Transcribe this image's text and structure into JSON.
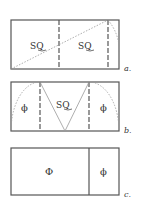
{
  "diagrams": [
    {
      "id": "a",
      "caption": "a.",
      "regions": [
        {
          "label": "SQ"
        },
        {
          "label": "SQ"
        }
      ]
    },
    {
      "id": "b",
      "caption": "b.",
      "regions": [
        {
          "label": "ϕ"
        },
        {
          "label": "SQ"
        },
        {
          "label": "ϕ"
        }
      ]
    },
    {
      "id": "c",
      "caption": "c.",
      "regions": [
        {
          "label": "Φ"
        },
        {
          "label": "ϕ"
        }
      ]
    }
  ],
  "colors": {
    "stroke": "#555555",
    "dotted": "#999999",
    "text": "#333333"
  }
}
